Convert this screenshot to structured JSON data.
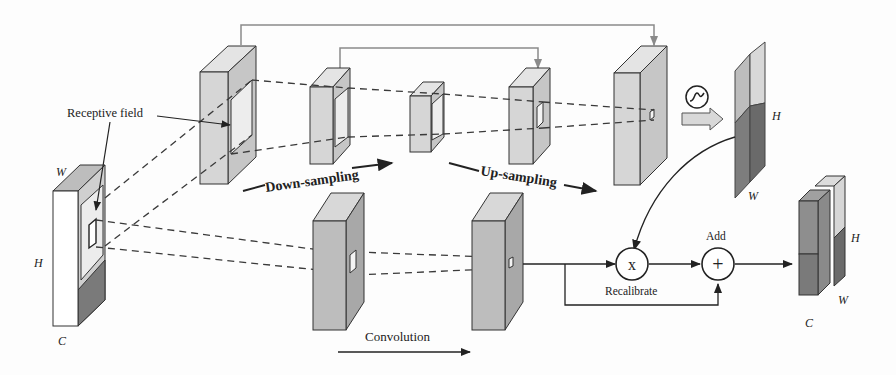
{
  "diagram": {
    "type": "neural-network-architecture",
    "labels": {
      "receptive_field": "Receptive field",
      "down_sampling": "Down-sampling",
      "up_sampling": "Up-sampling",
      "convolution": "Convolution",
      "recalibrate": "Recalibrate",
      "add": "Add",
      "input_W": "W",
      "input_H": "H",
      "input_C": "C",
      "attn_H": "H",
      "attn_W": "W",
      "out_H": "H",
      "out_W": "W",
      "out_C": "C"
    },
    "operators": {
      "multiply_symbol": "x",
      "add_symbol": "+",
      "sigmoid_icon": "sigmoid-icon"
    },
    "colors": {
      "block_front": "#d8d8d8",
      "block_top": "#e6e6e6",
      "block_side": "#c4c4c4",
      "dark_side": "#8e8e8e",
      "darker": "#6e6e6e",
      "stroke": "#3a3a3a",
      "skip_line": "#8a8a8a"
    },
    "nodes": [
      {
        "id": "input",
        "label": "Input feature map (H×W×C)"
      },
      {
        "id": "enc1",
        "label": "Encoder block 1"
      },
      {
        "id": "enc2",
        "label": "Encoder block 2"
      },
      {
        "id": "bottleneck",
        "label": "Bottleneck"
      },
      {
        "id": "dec1",
        "label": "Decoder block 1"
      },
      {
        "id": "dec2",
        "label": "Decoder block 2"
      },
      {
        "id": "attention",
        "label": "Sigmoid attention map"
      },
      {
        "id": "conv1",
        "label": "Convolution block 1"
      },
      {
        "id": "conv2",
        "label": "Convolution block 2"
      },
      {
        "id": "mul",
        "label": "Recalibrate (multiply)"
      },
      {
        "id": "add",
        "label": "Add"
      },
      {
        "id": "output",
        "label": "Output feature map"
      }
    ]
  }
}
